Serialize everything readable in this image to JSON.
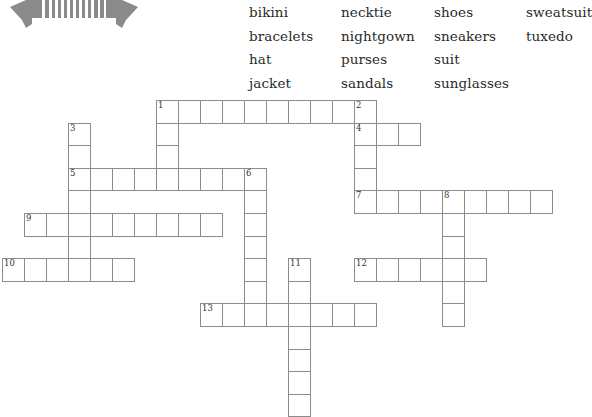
{
  "banner": {
    "icon": "double-arrow-banner-icon",
    "color": "#8a8a8a"
  },
  "word_bank": {
    "columns": [
      [
        "bikini",
        "bracelets",
        "hat",
        "jacket"
      ],
      [
        "necktie",
        "nightgown",
        "purses",
        "sandals"
      ],
      [
        "shoes",
        "sneakers",
        "suit",
        "sunglasses"
      ],
      [
        "sweatsuit",
        "tuxedo"
      ]
    ]
  },
  "puzzle": {
    "origin_x": 2,
    "origin_y": 100,
    "col_unit": 22,
    "row_unit": 22.6,
    "clues": [
      {
        "number": "1",
        "direction": "across",
        "row": 0,
        "col": 7,
        "length": 10
      },
      {
        "number": "1",
        "direction": "down",
        "row": 0,
        "col": 7,
        "length": 4
      },
      {
        "number": "2",
        "direction": "down",
        "row": 0,
        "col": 16,
        "length": 5
      },
      {
        "number": "3",
        "direction": "down",
        "row": 1,
        "col": 3,
        "length": 7
      },
      {
        "number": "4",
        "direction": "across",
        "row": 1,
        "col": 16,
        "length": 3
      },
      {
        "number": "5",
        "direction": "across",
        "row": 3,
        "col": 3,
        "length": 9
      },
      {
        "number": "6",
        "direction": "down",
        "row": 3,
        "col": 11,
        "length": 7
      },
      {
        "number": "7",
        "direction": "across",
        "row": 4,
        "col": 16,
        "length": 9
      },
      {
        "number": "8",
        "direction": "down",
        "row": 4,
        "col": 20,
        "length": 6
      },
      {
        "number": "9",
        "direction": "across",
        "row": 5,
        "col": 1,
        "length": 9
      },
      {
        "number": "10",
        "direction": "across",
        "row": 7,
        "col": 0,
        "length": 6
      },
      {
        "number": "11",
        "direction": "down",
        "row": 7,
        "col": 13,
        "length": 7
      },
      {
        "number": "12",
        "direction": "across",
        "row": 7,
        "col": 16,
        "length": 6
      },
      {
        "number": "13",
        "direction": "across",
        "row": 9,
        "col": 9,
        "length": 8
      }
    ]
  }
}
